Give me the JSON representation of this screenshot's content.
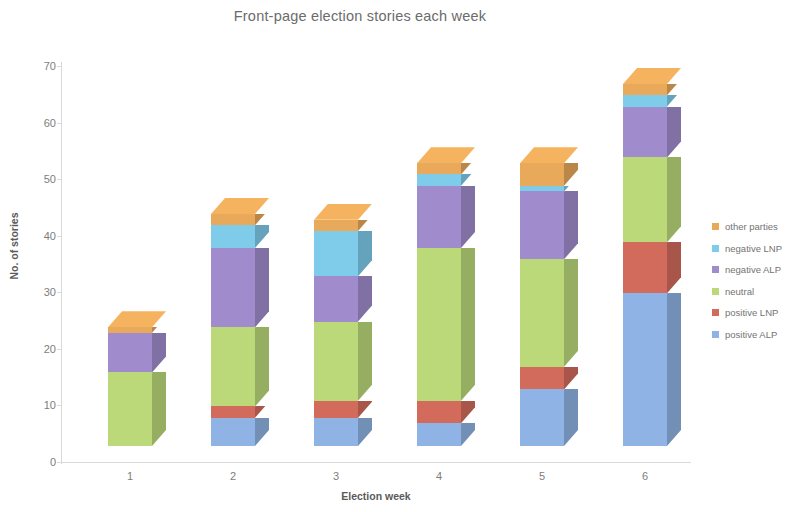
{
  "chart_data": {
    "type": "bar",
    "subtype": "stacked-column-3d",
    "title": "Front-page election stories each week",
    "xlabel": "Election week",
    "ylabel": "No. of stories",
    "categories": [
      "1",
      "2",
      "3",
      "4",
      "5",
      "6"
    ],
    "ylim": [
      0,
      70
    ],
    "yticks": [
      0,
      10,
      20,
      30,
      40,
      50,
      60,
      70
    ],
    "grid": false,
    "legend_position": "right",
    "series": [
      {
        "name": "positive ALP",
        "color": "#8eb3e4",
        "values": [
          0,
          5,
          5,
          4,
          10,
          27
        ]
      },
      {
        "name": "positive LNP",
        "color": "#d36b5c",
        "values": [
          0,
          2,
          3,
          4,
          4,
          9
        ]
      },
      {
        "name": "neutral",
        "color": "#bcd97a",
        "values": [
          13,
          14,
          14,
          27,
          19,
          15
        ]
      },
      {
        "name": "negative ALP",
        "color": "#a08ccc",
        "values": [
          7,
          14,
          8,
          11,
          12,
          9
        ]
      },
      {
        "name": "negative LNP",
        "color": "#7ecbea",
        "values": [
          0,
          4,
          8,
          2,
          1,
          2
        ]
      },
      {
        "name": "other parties",
        "color": "#e8a95a",
        "values": [
          1,
          2,
          2,
          2,
          4,
          2
        ]
      }
    ],
    "stack_order_bottom_to_top": [
      "positive ALP",
      "positive LNP",
      "neutral",
      "negative ALP",
      "negative LNP",
      "other parties"
    ],
    "totals": [
      21,
      41,
      40,
      50,
      50,
      64
    ]
  },
  "legend": {
    "items": [
      {
        "label": "other parties",
        "color": "#e8a95a"
      },
      {
        "label": "negative LNP",
        "color": "#7ecbea"
      },
      {
        "label": "negative ALP",
        "color": "#a08ccc"
      },
      {
        "label": "neutral",
        "color": "#bcd97a"
      },
      {
        "label": "positive LNP",
        "color": "#d36b5c"
      },
      {
        "label": "positive ALP",
        "color": "#8eb3e4"
      }
    ]
  },
  "axes": {
    "y_tick_labels": [
      "70",
      "60",
      "50",
      "40",
      "30",
      "20",
      "10",
      "0"
    ],
    "x_tick_labels": [
      "1",
      "2",
      "3",
      "4",
      "5",
      "6"
    ]
  }
}
